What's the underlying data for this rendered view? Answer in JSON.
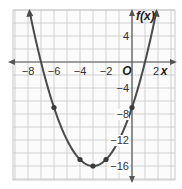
{
  "chart_data": {
    "type": "line",
    "title": "",
    "function": "f(x) = x^2 + 6x - 7",
    "xlabel": "x",
    "ylabel": "f(x)",
    "origin_label": "O",
    "xlim": [
      -9,
      3
    ],
    "ylim": [
      -18,
      8
    ],
    "x_ticks": [
      -8,
      -6,
      -4,
      -2,
      2
    ],
    "x_tick_labels": [
      "−8",
      "−6",
      "−4",
      "−2",
      "2"
    ],
    "y_ticks": [
      4,
      -4,
      -8,
      -12,
      -16
    ],
    "y_tick_labels": [
      "4",
      "−4",
      "−8",
      "−12",
      "−16"
    ],
    "grid": true,
    "grid_step": {
      "x": 1,
      "y": 2
    },
    "points": [
      {
        "x": -6,
        "y": -7
      },
      {
        "x": -4,
        "y": -15
      },
      {
        "x": -3,
        "y": -16
      },
      {
        "x": -2,
        "y": -15
      },
      {
        "x": 0,
        "y": -7
      }
    ],
    "vertex": {
      "x": -3,
      "y": -16
    },
    "roots": [
      -7,
      1
    ],
    "curve_color": "#4a4a4a"
  }
}
